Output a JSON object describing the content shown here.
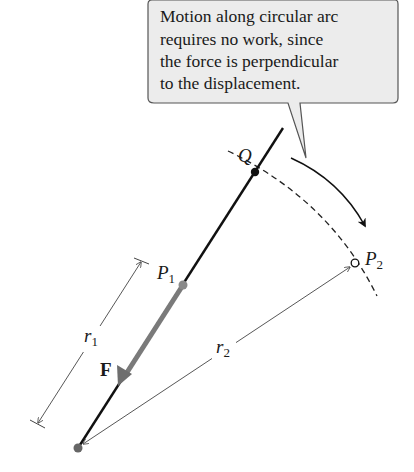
{
  "callout": {
    "lines": [
      "Motion along circular arc",
      "requires no work, since",
      "the force is perpendicular",
      "to the displacement."
    ],
    "fill": "#ececec",
    "stroke": "#555555"
  },
  "labels": {
    "Q": "Q",
    "P1": {
      "main": "P",
      "sub": "1"
    },
    "P2": {
      "main": "P",
      "sub": "2"
    },
    "r1": {
      "main": "r",
      "sub": "1"
    },
    "r2": {
      "main": "r",
      "sub": "2"
    },
    "F": "F"
  },
  "colors": {
    "line": "#111111",
    "force": "#7a7a7a",
    "point_gray": "#808080",
    "dim_line": "#444444"
  }
}
